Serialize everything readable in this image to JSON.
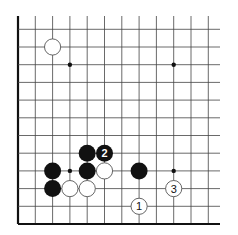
{
  "diagram": {
    "type": "go-board-fragment",
    "colors": {
      "background": "#ffffff",
      "grid_line": "#444444",
      "edge_line": "#111111",
      "black_stone": "#111111",
      "white_stone_fill": "#ffffff",
      "white_stone_stroke": "#555555",
      "number_on_black": "#ffffff",
      "number_on_white": "#111111"
    },
    "grid": {
      "columns": 12,
      "rows": 12,
      "left_edge_visible": true,
      "bottom_edge_visible": true,
      "top_edge_visible": false,
      "right_edge_visible": false
    },
    "star_points": [
      {
        "col": 3,
        "row": 9
      },
      {
        "col": 9,
        "row": 9
      },
      {
        "col": 3,
        "row": 3
      },
      {
        "col": 9,
        "row": 3
      }
    ],
    "stones": [
      {
        "color": "white",
        "col": 2,
        "row": 10,
        "label": ""
      },
      {
        "color": "black",
        "col": 4,
        "row": 4,
        "label": ""
      },
      {
        "color": "black",
        "col": 5,
        "row": 4,
        "label": "2"
      },
      {
        "color": "black",
        "col": 2,
        "row": 3,
        "label": ""
      },
      {
        "color": "black",
        "col": 4,
        "row": 3,
        "label": ""
      },
      {
        "color": "white",
        "col": 5,
        "row": 3,
        "label": ""
      },
      {
        "color": "black",
        "col": 7,
        "row": 3,
        "label": ""
      },
      {
        "color": "black",
        "col": 2,
        "row": 2,
        "label": ""
      },
      {
        "color": "white",
        "col": 3,
        "row": 2,
        "label": ""
      },
      {
        "color": "white",
        "col": 4,
        "row": 2,
        "label": ""
      },
      {
        "color": "white",
        "col": 9,
        "row": 2,
        "label": "3"
      },
      {
        "color": "white",
        "col": 7,
        "row": 1,
        "label": "1"
      }
    ]
  }
}
